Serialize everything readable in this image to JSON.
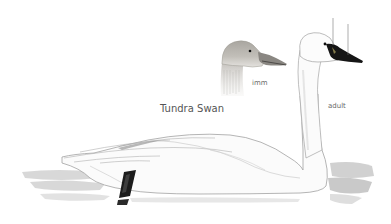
{
  "illustration": {
    "species_name": "Tundra Swan",
    "labels": {
      "immature": "imm",
      "adult": "adult"
    },
    "colors": {
      "background": "#ffffff",
      "plumage_adult": "#fbfbfb",
      "plumage_immature": "#b9b6b0",
      "bill_adult": "#151515",
      "bill_immature": "#6f6d6a",
      "outline": "#9a9a9a",
      "water_shadow": "#bdbdbd",
      "leg": "#1c1c1c",
      "label_text": "#555555",
      "pointer_line": "#777777"
    }
  }
}
